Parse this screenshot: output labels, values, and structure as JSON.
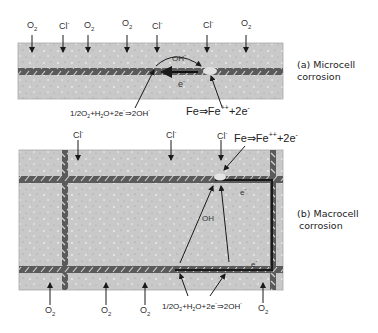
{
  "panels": {
    "microcell": {
      "caption_line1": "(a) Microcell",
      "caption_line2": "corrosion",
      "top_labels": [
        "O2",
        "Cl-",
        "O2",
        "O2",
        "Cl-",
        "Cl-",
        "O2"
      ],
      "oh_label": "OH-",
      "electron_label": "e-",
      "cathode_equation": "1/2O2+H2O+2e-⇒2OH-",
      "anode_equation": "Fe⇒Fe++ +2e-"
    },
    "macrocell": {
      "caption_line1": "(b) Macrocell",
      "caption_line2": "corrosion",
      "top_labels": [
        "Cl-",
        "Cl-",
        "Cl-"
      ],
      "bottom_labels": [
        "O2",
        "O2",
        "O2",
        "O2"
      ],
      "oh_label": "OH",
      "electron_label_top": "e-",
      "electron_label_bottom": "e-",
      "cathode_equation": "1/2O2+H2O+2e-⇒2OH-",
      "anode_equation": "Fe⇒Fe++ +2e-"
    }
  },
  "colors": {
    "concrete": "#c9c9c9",
    "concrete_edge": "#a9a9a9",
    "rebar": "#5a5a5a",
    "rebar_rib": "#d8d8d8",
    "arrow": "#1a1a1a"
  }
}
